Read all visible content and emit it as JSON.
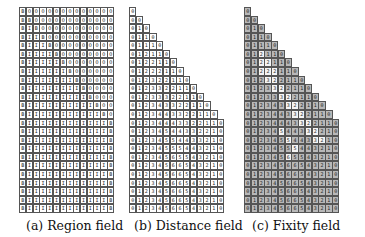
{
  "figure": {
    "panels": [
      {
        "id": "a",
        "caption": "(a) Region field",
        "legend": {
          "B": "boundary",
          "I": "inside",
          "O": "outside"
        },
        "rows": [
          "BOOOOOOOOOOOOO",
          "BBOOOOOOOOOOOO",
          "BIBOOOOOOOOOOO",
          "BIIBOOOOOOOOOO",
          "BIIIBOOOOOOOOO",
          "BIIIIBOOOOOOOO",
          "BIIIIIBOOOOOOO",
          "BIIIIIIBOOOOOO",
          "BIIIIIIIBOOOOO",
          "BIIIIIIIIBOOOO",
          "BIIIIIIIIIBOOO",
          "BIIIIIIIIIIBOO",
          "BIIIIIIIIIIIBO",
          "BIIIIIIIIIIIIB",
          "BIIIIIIIIIIIIB",
          "BIIIIIIIIIIIIB",
          "BIIIIIIIIIIIIB",
          "BIIIIIIIIIIIIB",
          "BIIIIIIIIIIIIB",
          "BIIIIIIIIIIIIB",
          "BIIIIIIIIIIIIB",
          "BIIIIIIIIIIIIB",
          "BIIIIIIIIIIIIB",
          "BIIIIIIIIIIIIB"
        ]
      },
      {
        "id": "b",
        "caption": "(b) Distance field",
        "rows": [
          "0",
          "00",
          "010",
          "0110",
          "01110",
          "012110",
          "0122110",
          "01222110",
          "012322110",
          "0123322110",
          "01233322110",
          "012343322110",
          "0123443322110",
          "01234443322110",
          "01234544332210",
          "01234554433210",
          "01234555443210",
          "01234565543210",
          "01234566543210",
          "01234566543210",
          "01234566543210",
          "01234566543210",
          "01234566543210",
          "01234566543210"
        ]
      },
      {
        "id": "c",
        "caption": "(c) Fixity field",
        "colors": {
          "fixed": "#b8b8b8",
          "free": "#f4f4f4"
        },
        "rows": [
          "0",
          "00",
          "010",
          "0110",
          "01110",
          "012110",
          "0122110",
          "01222110",
          "012322110",
          "0123322110",
          "01233322110",
          "012343322110",
          "0123443322110",
          "01234443322110",
          "01234544332210",
          "01234554433210",
          "01234555443210",
          "01234565543210",
          "01234566543210",
          "01234566543210",
          "01234566543210",
          "01234566543210",
          "01234566543210",
          "01234566543210"
        ],
        "free_mask": [
          "F",
          "FF",
          "FFF",
          "FFFF",
          "FFFFF",
          "FFfFFF",
          "FFffFFF",
          "FFfffFFF",
          "FFFffFFFF",
          "FFFFffFFFF",
          "FFFFFffFFFF",
          "FFFFFFffFFFF",
          "FFFFFFFffFFFF",
          "FFFFFFFFffFFFF",
          "FFFFFfFFFffFFF",
          "FFFFFFfFFFffFF",
          "FFFFFFFfFFFFFF",
          "FFFFFFfFFFFFFF",
          "FFFFFFFFFFFFFF",
          "FFFFFFFFFFFFFF",
          "FFFFFFFFFFFFFF",
          "FFFFFFFFFFFFFF",
          "FFFFFFFFFFFFFF",
          "FFFFFFFFFFFFFF"
        ]
      }
    ]
  }
}
